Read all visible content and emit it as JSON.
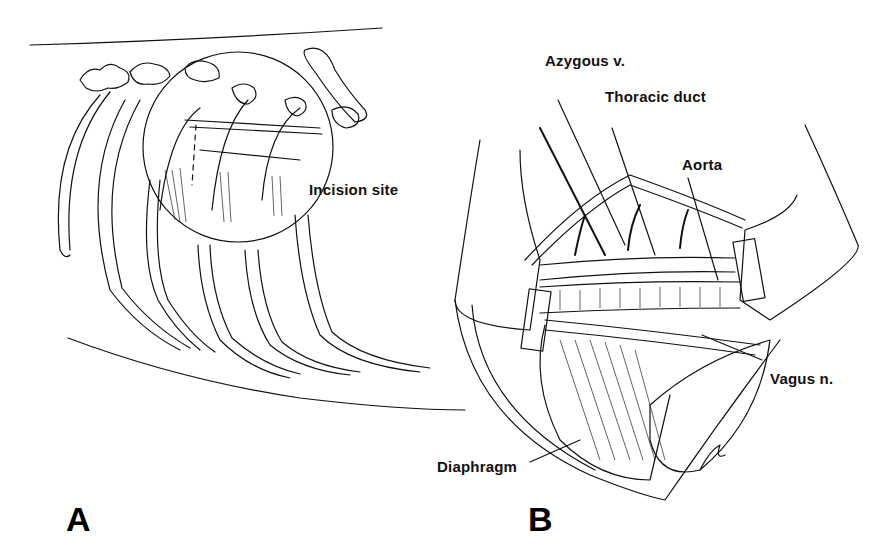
{
  "figure": {
    "panels": [
      {
        "letter": "A",
        "description": "Lateral view of canine thorax ribs with magnified circle showing incision site",
        "labels": [
          {
            "id": "incision_site",
            "text": "Incision site"
          }
        ]
      },
      {
        "letter": "B",
        "description": "Opened thoracotomy with retractors exposing intrathoracic structures",
        "labels": [
          {
            "id": "azygous",
            "text": "Azygous v."
          },
          {
            "id": "thoracic_duct",
            "text": "Thoracic duct"
          },
          {
            "id": "aorta",
            "text": "Aorta"
          },
          {
            "id": "vagus",
            "text": "Vagus n."
          },
          {
            "id": "diaphragm",
            "text": "Diaphragm"
          }
        ]
      }
    ],
    "colors": {
      "ink": "#111111",
      "background": "#ffffff"
    }
  }
}
